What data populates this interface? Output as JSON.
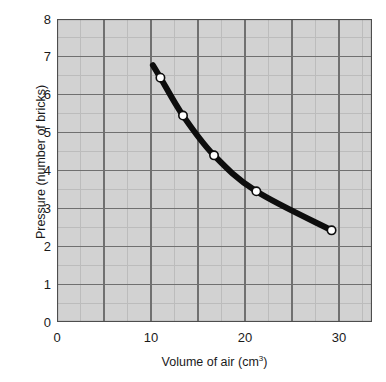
{
  "chart_data": {
    "type": "line",
    "title": "",
    "xlabel": "Volume of air (cm3)",
    "xlabel_base": "Volume of air (cm",
    "xlabel_sup": "3",
    "xlabel_close": ")",
    "ylabel": "Pressure (number of bricks)",
    "xlim": [
      0,
      33.5
    ],
    "ylim": [
      0,
      8
    ],
    "xticks": [
      0,
      10,
      20,
      30
    ],
    "xtick_labels": [
      "0",
      "10",
      "20",
      "30"
    ],
    "yticks": [
      0,
      1,
      2,
      3,
      4,
      5,
      6,
      7,
      8
    ],
    "ytick_labels": [
      "0",
      "1",
      "2",
      "3",
      "4",
      "5",
      "6",
      "7",
      "8"
    ],
    "x_major_step": 5,
    "x_minor_step": 2.5,
    "y_major_step": 1,
    "y_minor_step": 0.5,
    "grid": true,
    "legend": "none",
    "series": [
      {
        "name": "Pressure vs volume",
        "marker": "open-circle",
        "line_color": "#0d0d0d",
        "marker_face": "#ffffff",
        "x": [
          11.0,
          13.4,
          16.7,
          21.2,
          29.2
        ],
        "y": [
          6.45,
          5.45,
          4.4,
          3.45,
          2.42
        ]
      }
    ],
    "curve_extension_start": {
      "x": 10.2,
      "y": 6.78
    },
    "colors": {
      "plot_background": "#d2d2d2",
      "major_gridline": "#707070",
      "minor_gridline": "#bcbcbc",
      "axis": "#4d4d4d",
      "curve": "#0d0d0d",
      "marker_fill": "#ffffff",
      "text": "#1a1a1a",
      "page_background": "#ffffff"
    }
  }
}
